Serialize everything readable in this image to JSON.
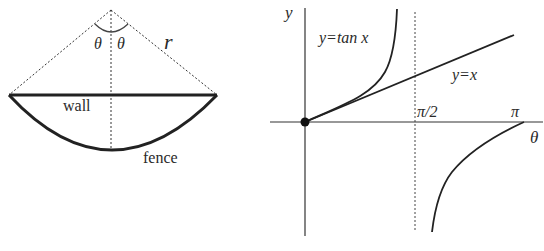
{
  "left_diagram": {
    "labels": {
      "theta_left": "θ",
      "theta_right": "θ",
      "radius": "r",
      "wall": "wall",
      "fence": "fence"
    }
  },
  "right_graph": {
    "axis_labels": {
      "y": "y",
      "x": "θ"
    },
    "tick_labels": {
      "half_pi": "π/2",
      "pi": "π"
    },
    "curve_labels": {
      "tan": "y=tan x",
      "identity": "y=x"
    }
  },
  "colors": {
    "ink": "#2a2a2a",
    "background": "#ffffff"
  }
}
